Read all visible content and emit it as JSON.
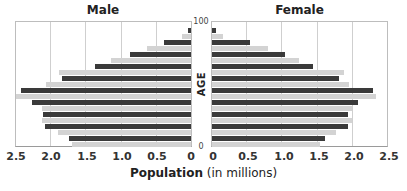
{
  "chart_data": {
    "type": "bar",
    "subtype": "population-pyramid",
    "panels": [
      {
        "name": "Male",
        "direction": "left"
      },
      {
        "name": "Female",
        "direction": "right"
      }
    ],
    "ylabel": "AGE",
    "y_range_labels": {
      "top": "100",
      "bottom": "0"
    },
    "age_groups_top_to_bottom": [
      "90-100",
      "80-90",
      "70-80",
      "60-70",
      "50-60",
      "40-50",
      "30-40",
      "20-30",
      "10-20",
      "0-10"
    ],
    "xlabel_bold": "Population",
    "xlabel_rest": " (in millions)",
    "xlim": [
      0,
      2.5
    ],
    "x_ticks": [
      "2.5",
      "2.0",
      "1.5",
      "1.0",
      "0.5",
      "0",
      "0",
      "0.5",
      "1.0",
      "1.5",
      "2.0",
      "2.5"
    ],
    "grid": true,
    "legend": null,
    "series": [
      {
        "name": "dark",
        "color": "#3a3a3a",
        "male": [
          0.04,
          0.39,
          0.87,
          1.37,
          1.83,
          2.41,
          2.26,
          2.1,
          2.07,
          1.74
        ],
        "female": [
          0.06,
          0.54,
          1.04,
          1.43,
          1.8,
          2.29,
          2.07,
          1.93,
          1.93,
          1.6
        ]
      },
      {
        "name": "light",
        "color": "#d3d3d3",
        "male": [
          0.13,
          0.63,
          1.13,
          1.87,
          2.06,
          2.49,
          2.11,
          2.11,
          1.89,
          1.69
        ],
        "female": [
          0.16,
          0.8,
          1.24,
          1.87,
          1.94,
          2.33,
          1.99,
          1.99,
          1.76,
          1.54
        ]
      }
    ]
  },
  "labels": {
    "male_title": "Male",
    "female_title": "Female",
    "age_top": "100",
    "age_bottom": "0",
    "age_axis": "AGE",
    "xlabel_bold": "Population",
    "xlabel_rest": " (in millions)"
  }
}
